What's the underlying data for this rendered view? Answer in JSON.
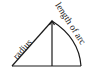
{
  "diagram": {
    "type": "sector-geometry",
    "labels": {
      "radius": "radius",
      "arc": "length of arc"
    },
    "points": {
      "apex": [
        52,
        21
      ],
      "base_left": [
        12,
        66
      ],
      "base_foot": [
        52,
        66
      ],
      "base_right": [
        81,
        66
      ]
    },
    "colors": {
      "stroke": "#1a1a1a",
      "background": "#ffffff"
    }
  }
}
